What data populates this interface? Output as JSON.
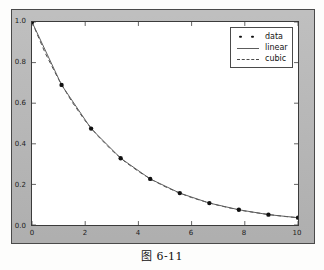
{
  "caption": "图 6-11",
  "figure": {
    "background_color": "#b8b8b8",
    "axes_background_color": "#ffffff",
    "frame_color": "#3b3b3b"
  },
  "legend": {
    "position": "upper right",
    "entries": [
      {
        "label": "data",
        "key": "markers",
        "color": "#111111"
      },
      {
        "label": "linear",
        "key": "solid-line",
        "color": "#5c5c5c"
      },
      {
        "label": "cubic",
        "key": "dashed-line",
        "color": "#4a4a4a"
      }
    ]
  },
  "chart_data": {
    "type": "line",
    "title": "",
    "xlabel": "",
    "ylabel": "",
    "xlim": [
      0,
      10
    ],
    "ylim": [
      0,
      1.0
    ],
    "grid": false,
    "xticks": [
      0,
      2,
      4,
      6,
      8,
      10
    ],
    "xtick_labels": [
      "0",
      "2",
      "4",
      "6",
      "8",
      "10"
    ],
    "yticks": [
      0.0,
      0.2,
      0.4,
      0.6,
      0.8,
      1.0
    ],
    "ytick_labels": [
      "0.0",
      "0.2",
      "0.4",
      "0.6",
      "0.8",
      "1.0"
    ],
    "series": [
      {
        "name": "data",
        "style": "markers",
        "marker": "circle",
        "color": "#111111",
        "x": [
          0.0,
          1.111,
          2.222,
          3.333,
          4.444,
          5.556,
          6.667,
          7.778,
          8.889,
          10.0
        ],
        "y": [
          1.0,
          0.69,
          0.475,
          0.329,
          0.227,
          0.157,
          0.108,
          0.075,
          0.051,
          0.036
        ]
      },
      {
        "name": "linear",
        "style": "solid",
        "color": "#5c5c5c",
        "x": [
          0.0,
          1.111,
          2.222,
          3.333,
          4.444,
          5.556,
          6.667,
          7.778,
          8.889,
          10.0
        ],
        "y": [
          1.0,
          0.69,
          0.475,
          0.329,
          0.227,
          0.157,
          0.108,
          0.075,
          0.051,
          0.036
        ]
      },
      {
        "name": "cubic",
        "style": "dashed",
        "color": "#4a4a4a",
        "x": [
          0.0,
          0.5,
          1.0,
          1.5,
          2.0,
          2.5,
          3.0,
          3.5,
          4.0,
          4.5,
          5.0,
          5.5,
          6.0,
          6.5,
          7.0,
          7.5,
          8.0,
          8.5,
          9.0,
          9.5,
          10.0
        ],
        "y": [
          1.0,
          0.846,
          0.717,
          0.607,
          0.513,
          0.435,
          0.368,
          0.311,
          0.264,
          0.223,
          0.189,
          0.16,
          0.135,
          0.115,
          0.097,
          0.082,
          0.069,
          0.059,
          0.05,
          0.042,
          0.036
        ]
      }
    ]
  }
}
